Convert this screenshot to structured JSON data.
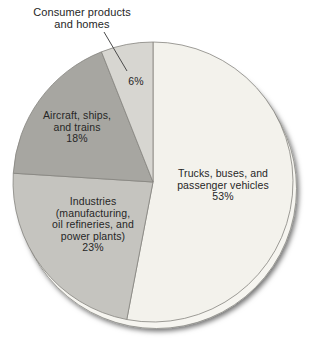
{
  "chart_data": {
    "type": "pie",
    "title": "",
    "direction": "clockwise",
    "start_angle_deg": 0,
    "legend_position": "none",
    "slices": [
      {
        "label": "Trucks, buses, and passenger vehicles",
        "value": 53,
        "percent_label": "53%",
        "color": "#f3f2ec",
        "label_lines": "Trucks, buses, and\npassenger vehicles\n53%"
      },
      {
        "label": "Industries (manufacturing, oil refineries, and power plants)",
        "value": 23,
        "percent_label": "23%",
        "color": "#c5c4bf",
        "label_lines": "Industries\n(manufacturing,\noil refineries, and\npower plants)\n23%"
      },
      {
        "label": "Aircraft, ships, and trains",
        "value": 18,
        "percent_label": "18%",
        "color": "#a7a6a1",
        "label_lines": "Aircraft, ships,\nand trains\n18%"
      },
      {
        "label": "Consumer products and homes",
        "value": 6,
        "percent_label": "6%",
        "color": "#d7d6d1",
        "label_lines": "Consumer products\nand homes",
        "value_label": "6%"
      }
    ],
    "style": {
      "slice_stroke_color": "#85847f",
      "text_color": "#262626",
      "rim_fill": "#f6f5f0",
      "rim_stroke": "#8c8b86",
      "leader_line_color": "#4a4a4a",
      "background": "#ffffff"
    }
  }
}
